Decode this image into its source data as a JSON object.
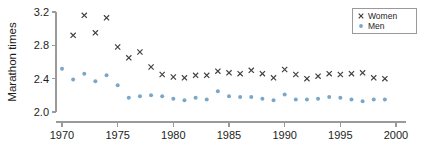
{
  "chart_data": {
    "type": "scatter",
    "title": "",
    "xlabel": "",
    "ylabel": "Marathon times",
    "xlim": [
      1969,
      2000.5
    ],
    "ylim": [
      2.0,
      3.2
    ],
    "xticks": [
      1970,
      1975,
      1980,
      1985,
      1990,
      1995,
      2000
    ],
    "xticklabels": [
      "1970",
      "1975",
      "1980",
      "1985",
      "1990",
      "1995",
      "2000"
    ],
    "yticks": [
      2.0,
      2.4,
      2.8,
      3.2
    ],
    "yticklabels": [
      "2.0",
      "2.4",
      "2.8",
      "3.2"
    ],
    "grid": false,
    "legend_position": "top-right",
    "x": [
      1970,
      1971,
      1972,
      1973,
      1974,
      1975,
      1976,
      1977,
      1978,
      1979,
      1980,
      1981,
      1982,
      1983,
      1984,
      1985,
      1986,
      1987,
      1988,
      1989,
      1990,
      1991,
      1992,
      1993,
      1994,
      1995,
      1996,
      1997,
      1998,
      1999
    ],
    "series": [
      {
        "name": "Women",
        "marker": "x",
        "color": "#3f3f3f",
        "values": [
          null,
          2.92,
          3.16,
          2.95,
          3.13,
          2.78,
          2.65,
          2.72,
          2.54,
          2.45,
          2.42,
          2.41,
          2.44,
          2.44,
          2.49,
          2.47,
          2.46,
          2.5,
          2.46,
          2.41,
          2.51,
          2.45,
          2.4,
          2.43,
          2.46,
          2.45,
          2.46,
          2.47,
          2.41,
          2.4
        ]
      },
      {
        "name": "Men",
        "marker": "circle",
        "color": "#7aa7c7",
        "values": [
          2.52,
          2.39,
          2.46,
          2.37,
          2.44,
          2.32,
          2.17,
          2.19,
          2.2,
          2.19,
          2.16,
          2.14,
          2.17,
          2.15,
          2.25,
          2.19,
          2.18,
          2.18,
          2.16,
          2.14,
          2.21,
          2.15,
          2.15,
          2.16,
          2.18,
          2.17,
          2.15,
          2.13,
          2.15,
          2.15
        ]
      }
    ]
  },
  "legend": {
    "entries": [
      {
        "label": "Women"
      },
      {
        "label": "Men"
      }
    ]
  }
}
